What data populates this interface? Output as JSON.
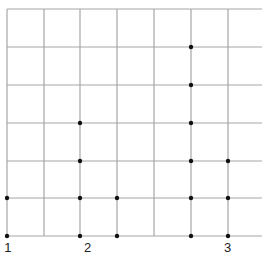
{
  "diagram": {
    "type": "dot-grid",
    "grid": {
      "columns_x": [
        7,
        44,
        80,
        117,
        154,
        191,
        228
      ],
      "rows_y": [
        9,
        47,
        85,
        123,
        161,
        198,
        236
      ],
      "extend_right_to": 262,
      "line_color": "#a6a6a6",
      "dot_color": "#111111"
    },
    "dots": [
      {
        "x": 7,
        "y": 198
      },
      {
        "x": 7,
        "y": 236
      },
      {
        "x": 80,
        "y": 123
      },
      {
        "x": 80,
        "y": 161
      },
      {
        "x": 80,
        "y": 198
      },
      {
        "x": 80,
        "y": 236
      },
      {
        "x": 117,
        "y": 198
      },
      {
        "x": 117,
        "y": 236
      },
      {
        "x": 191,
        "y": 47
      },
      {
        "x": 191,
        "y": 85
      },
      {
        "x": 191,
        "y": 123
      },
      {
        "x": 191,
        "y": 161
      },
      {
        "x": 191,
        "y": 198
      },
      {
        "x": 191,
        "y": 236
      },
      {
        "x": 228,
        "y": 161
      },
      {
        "x": 228,
        "y": 198
      },
      {
        "x": 228,
        "y": 236
      }
    ],
    "labels": [
      {
        "text": ": 1",
        "x": -3,
        "y": 241
      },
      {
        "text": "2",
        "x": 84,
        "y": 241
      },
      {
        "text": "3",
        "x": 224,
        "y": 241
      }
    ]
  }
}
